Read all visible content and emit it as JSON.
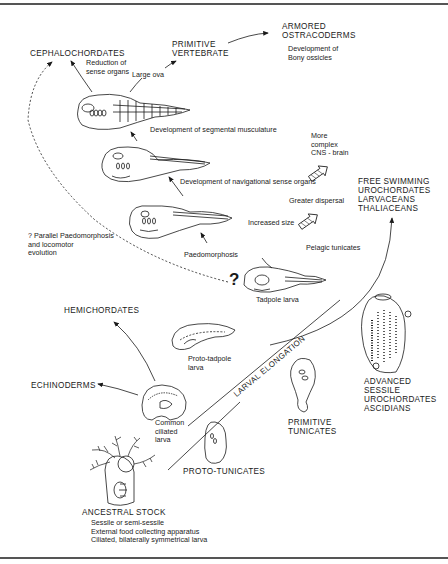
{
  "groups": {
    "armored_ostracoderms": [
      "ARMORED",
      "OSTRACODERMS"
    ],
    "primitive_vertebrate": [
      "PRIMITIVE",
      "VERTEBRATE"
    ],
    "cephalochordates": [
      "CEPHALOCHORDATES"
    ],
    "free_swimming": [
      "FREE SWIMMING",
      "UROCHORDATES",
      "LARVACEANS",
      "THALIACEANS"
    ],
    "hemichordates": [
      "HEMICHORDATES"
    ],
    "echinoderms": [
      "ECHINODERMS"
    ],
    "advanced_sessile": [
      "ADVANCED",
      "SESSILE",
      "UROCHORDATES",
      "ASCIDIANS"
    ],
    "primitive_tunicates": [
      "PRIMITIVE",
      "TUNICATES"
    ],
    "proto_tunicates": [
      "PROTO-TUNICATES"
    ],
    "ancestral_stock": [
      "ANCESTRAL STOCK"
    ]
  },
  "annotations": {
    "bony_ossicles": [
      "Development of",
      "Bony ossicles"
    ],
    "reduction_sense": [
      "Reduction of",
      "sense organs"
    ],
    "large_ova": "Large ova",
    "segmental": "Development of segmental musculature",
    "navigational": "Development of navigational sense organs",
    "more_complex": [
      "More",
      "complex",
      "CNS - brain"
    ],
    "greater_dispersal": "Greater dispersal",
    "increased_size": "Increased size",
    "paedomorphosis": "Paedomorphosis",
    "pelagic_tunicates": "Pelagic tunicates",
    "parallel": [
      "? Parallel Paedomorphosis",
      "and locomotor",
      "evolution"
    ],
    "tadpole_larva": "Tadpole larva",
    "proto_tadpole": [
      "Proto-tadpole",
      "larva"
    ],
    "common_ciliated": [
      "Common",
      "ciliated",
      "larva"
    ],
    "ancestral_traits": [
      "Sessile or semi-sessile",
      "External food collecting apparatus",
      "Ciliated, bilaterally symmetrical larva"
    ],
    "larval_elongation": "LARVAL ELONGATION",
    "question_mark": "?",
    "led_to": "led to"
  }
}
